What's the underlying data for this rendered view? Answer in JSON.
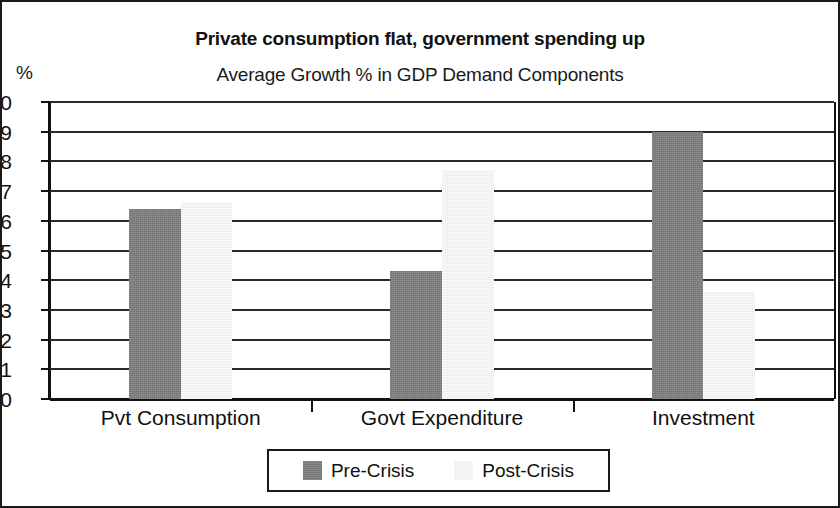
{
  "chart_data": {
    "type": "bar",
    "title": "Private consumption flat, government spending up",
    "subtitle": "Average Growth % in GDP Demand Components",
    "xlabel": "",
    "ylabel": "%",
    "ylim": [
      0,
      10
    ],
    "ytick_step": 1,
    "yticks": [
      "10",
      "9",
      "8",
      "7",
      "6",
      "5",
      "4",
      "3",
      "2",
      "1",
      "0"
    ],
    "grid": true,
    "legend_position": "bottom",
    "categories": [
      "Pvt Consumption",
      "Govt Expenditure",
      "Investment"
    ],
    "series": [
      {
        "name": "Pre-Crisis",
        "color": "#808080",
        "values": [
          6.4,
          4.3,
          9.0
        ]
      },
      {
        "name": "Post-Crisis",
        "color": "#f2f2f2",
        "values": [
          6.65,
          7.7,
          3.6
        ]
      }
    ]
  },
  "legend": {
    "entries": [
      {
        "label": "Pre-Crisis"
      },
      {
        "label": "Post-Crisis"
      }
    ]
  },
  "colors": {
    "pre_crisis": "#808080",
    "post_crisis": "#f2f2f2",
    "axis": "#111111",
    "background": "#ffffff"
  }
}
